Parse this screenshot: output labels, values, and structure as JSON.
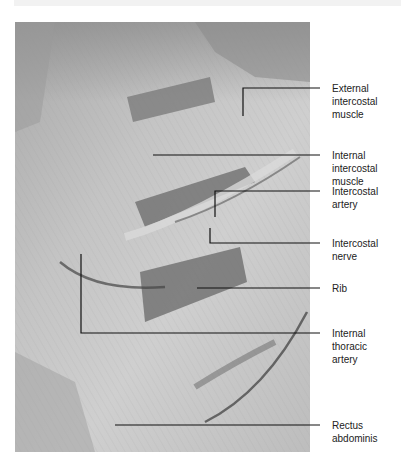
{
  "figure": {
    "labels": [
      {
        "id": "external-intercostal-muscle",
        "text": "External\nintercostal\nmuscle",
        "top": 82
      },
      {
        "id": "internal-intercostal-muscle",
        "text": "Internal\nintercostal\nmuscle",
        "top": 149
      },
      {
        "id": "intercostal-artery",
        "text": "Intercostal\nartery",
        "top": 185
      },
      {
        "id": "intercostal-nerve",
        "text": "Intercostal\nnerve",
        "top": 237
      },
      {
        "id": "rib",
        "text": "Rib",
        "top": 282
      },
      {
        "id": "internal-thoracic-artery",
        "text": "Internal\nthoracic\nartery",
        "top": 327
      },
      {
        "id": "rectus-abdominis",
        "text": "Rectus\nabdominis",
        "top": 419
      }
    ]
  }
}
